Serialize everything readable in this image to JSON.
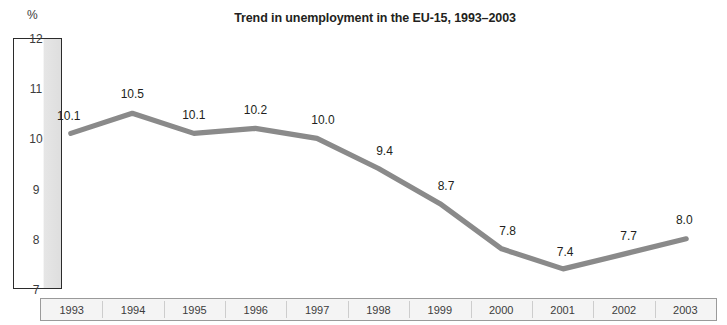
{
  "chart_data": {
    "type": "line",
    "title": "Trend in unemployment in the EU-15, 1993–2003",
    "xlabel": "",
    "ylabel": "%",
    "unit_label": "%",
    "categories": [
      "1993",
      "1994",
      "1995",
      "1996",
      "1997",
      "1998",
      "1999",
      "2000",
      "2001",
      "2002",
      "2003"
    ],
    "values": [
      10.1,
      10.5,
      10.1,
      10.2,
      10.0,
      9.4,
      8.7,
      7.8,
      7.4,
      7.7,
      8.0
    ],
    "point_labels": [
      "10.1",
      "10.5",
      "10.1",
      "10.2",
      "10.0",
      "9.4",
      "8.7",
      "7.8",
      "7.4",
      "7.7",
      "8.0"
    ],
    "ylim": [
      7,
      12
    ],
    "yticks": [
      12,
      11,
      10,
      9,
      8,
      7
    ],
    "ytick_labels": [
      "12",
      "11",
      "10",
      "9",
      "8",
      "7"
    ],
    "grid": false,
    "legend": null,
    "series_color": "#8a8a8a",
    "axis_box_color": "#2b2b2b",
    "text_color": "#231f20"
  }
}
